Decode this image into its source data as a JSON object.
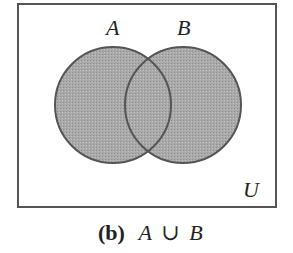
{
  "diagram": {
    "type": "venn",
    "universe_label": "U",
    "sets": [
      {
        "label": "A",
        "cx": 113,
        "cy": 105,
        "r": 58
      },
      {
        "label": "B",
        "cx": 183,
        "cy": 105,
        "r": 58
      }
    ],
    "shaded_region": "A ∪ B",
    "fill_color": "#a8a8a8",
    "stroke_color": "#555555",
    "caption": {
      "tag": "(b)",
      "expression_left": "A",
      "operator": "∪",
      "expression_right": "B"
    }
  }
}
